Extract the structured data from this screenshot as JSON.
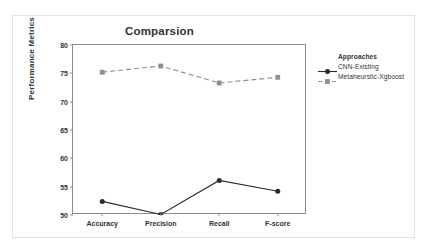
{
  "chart_data": {
    "type": "line",
    "title": "Comparsion",
    "xlabel": "",
    "ylabel": "Performance Metrics",
    "categories": [
      "Accuracy",
      "Precision",
      "Recall",
      "F-score"
    ],
    "ylim": [
      50,
      80
    ],
    "yticks": [
      50,
      55,
      60,
      65,
      70,
      75,
      80
    ],
    "grid": false,
    "legend_position": "right",
    "legend_title": "Approaches",
    "series": [
      {
        "name": "CNN-Existing",
        "values": [
          52.4,
          50.1,
          56.1,
          54.2
        ],
        "color": "#2b2b2b",
        "marker": "circle",
        "linestyle": "solid"
      },
      {
        "name": "Metaheurstic-Xgboost",
        "values": [
          75.2,
          76.3,
          73.3,
          74.3
        ],
        "color": "#8b9094",
        "marker": "square",
        "linestyle": "dashed"
      }
    ]
  },
  "colors": {
    "axis": "#8a8d8f",
    "text": "#303436",
    "frame": "#e2e2e2",
    "background": "#ffffff"
  }
}
